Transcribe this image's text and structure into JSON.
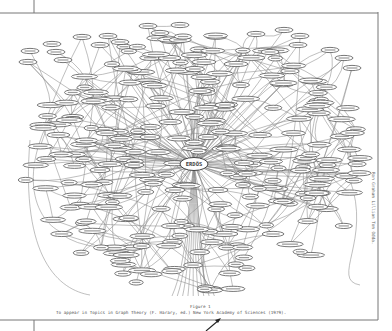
{
  "diagram": {
    "center_node": "ERDÖS",
    "hub_nodes": [
      "GRAHAM",
      "TUTTE",
      "HARARY",
      "SPENCER",
      "LOVASZ",
      "SOS",
      "SZEMEREDI",
      "STRAUS",
      "PACH",
      "RENYI"
    ],
    "caption": {
      "figure_label": "Figure 1",
      "line": "To appear in Topics in Graph Theory (F. Harary, ed.) New York Academy of Sciences (1979)."
    },
    "side_note": "Ron Graham  Lillian Tom Odda.",
    "annotation_arrow": "arrow pointing to caption"
  },
  "colors": {
    "ink": "#555555",
    "edges": "#8a8a8a",
    "paper": "#ffffff",
    "frame": "#777777"
  }
}
